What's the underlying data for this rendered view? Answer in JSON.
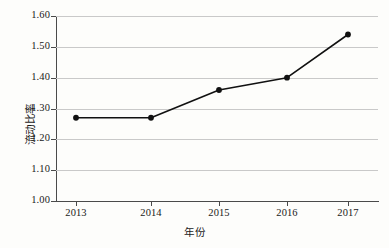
{
  "chart_data": {
    "type": "line",
    "title": "",
    "xlabel": "年份",
    "ylabel": "流动比率",
    "categories": [
      "2013",
      "2014",
      "2015",
      "2016",
      "2017"
    ],
    "values": [
      1.27,
      1.27,
      1.36,
      1.4,
      1.54
    ],
    "series": [
      {
        "name": "流动比率",
        "values": [
          1.27,
          1.27,
          1.36,
          1.4,
          1.54
        ]
      }
    ],
    "ylim": [
      1.0,
      1.6
    ],
    "ytick_step": 0.1,
    "ytick_labels": [
      "1.00",
      "1.10",
      "1.20",
      "1.30",
      "1.40",
      "1.50",
      "1.60"
    ],
    "ytick_values": [
      1.0,
      1.1,
      1.2,
      1.3,
      1.4,
      1.5,
      1.6
    ],
    "grid": "horizontal",
    "legend": "none",
    "marker": "filled-circle",
    "line_color": "#111111",
    "grid_color": "#c9c9c9",
    "axis_color": "#4a4a4a",
    "background": "#fdfdfb"
  }
}
